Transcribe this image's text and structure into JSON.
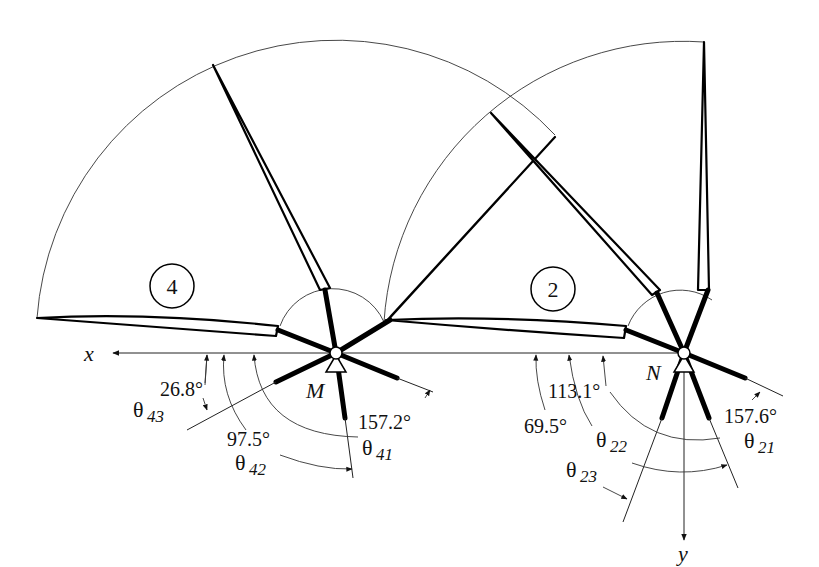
{
  "diagram": {
    "axes": {
      "x_label": "x",
      "y_label": "y"
    },
    "pivots": [
      {
        "id": "M",
        "label": "M"
      },
      {
        "id": "N",
        "label": "N"
      }
    ],
    "regions": [
      {
        "id": "4",
        "label": "4"
      },
      {
        "id": "2",
        "label": "2"
      }
    ],
    "angles": {
      "theta43": {
        "symbol": "θ",
        "subscript": "43",
        "value": "26.8°"
      },
      "theta42": {
        "symbol": "θ",
        "subscript": "42",
        "value": "97.5°"
      },
      "theta41": {
        "symbol": "θ",
        "subscript": "41",
        "value": "157.2°"
      },
      "theta23": {
        "symbol": "θ",
        "subscript": "23",
        "value": "69.5°"
      },
      "theta22": {
        "symbol": "θ",
        "subscript": "22",
        "value": "113.1°"
      },
      "theta21": {
        "symbol": "θ",
        "subscript": "21",
        "value": "157.6°"
      }
    }
  }
}
